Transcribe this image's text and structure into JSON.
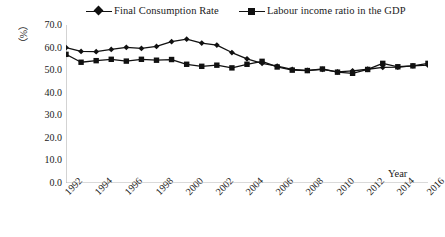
{
  "chart_data": {
    "type": "line",
    "title": "",
    "xlabel": "Year",
    "ylabel": "（%）",
    "x": [
      1992,
      1993,
      1994,
      1995,
      1996,
      1997,
      1998,
      1999,
      2000,
      2001,
      2002,
      2003,
      2004,
      2005,
      2006,
      2007,
      2008,
      2009,
      2010,
      2011,
      2012,
      2013,
      2014,
      2015,
      2016
    ],
    "xlim": [
      1992,
      2016
    ],
    "ylim": [
      0.0,
      70.0
    ],
    "yticks": [
      "0.0",
      "10.0",
      "20.0",
      "30.0",
      "40.0",
      "50.0",
      "60.0",
      "70.0"
    ],
    "xticks": [
      "1992",
      "1994",
      "1996",
      "1998",
      "2000",
      "2002",
      "2004",
      "2006",
      "2008",
      "2010",
      "2012",
      "2014",
      "2016"
    ],
    "grid": false,
    "legend_position": "top",
    "series": [
      {
        "name": "Final Consumption Rate",
        "marker": "diamond",
        "color": "#111111",
        "values": [
          60.0,
          58.3,
          58.2,
          59.2,
          60.1,
          59.6,
          60.5,
          62.6,
          63.7,
          62.0,
          61.1,
          57.8,
          55.0,
          53.0,
          51.8,
          50.3,
          49.9,
          50.3,
          49.2,
          49.7,
          50.4,
          51.2,
          51.3,
          51.9,
          52.2
        ]
      },
      {
        "name": "Labour income ratio in the GDP",
        "marker": "square",
        "color": "#111111",
        "values": [
          57.0,
          53.5,
          54.2,
          54.8,
          54.0,
          54.8,
          54.4,
          54.7,
          52.6,
          51.7,
          52.2,
          51.0,
          52.6,
          53.9,
          51.4,
          50.0,
          49.8,
          50.5,
          49.1,
          48.6,
          50.3,
          53.0,
          51.5,
          51.9,
          53.0
        ]
      }
    ]
  }
}
